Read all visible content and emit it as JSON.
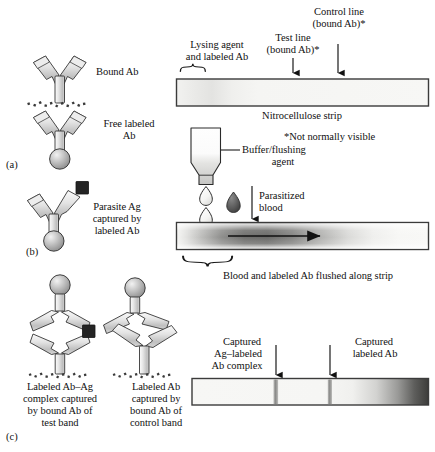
{
  "figure": {
    "panels": [
      "(a)",
      "(b)",
      "(c)"
    ]
  },
  "panel_labels": {
    "a": "(a)",
    "b": "(b)",
    "c": "(c)"
  },
  "left_column": {
    "bound_ab": "Bound Ab",
    "free_labeled_ab_line1": "Free labeled",
    "free_labeled_ab_line2": "Ab",
    "parasite_ag_line1": "Parasite Ag",
    "parasite_ag_line2": "captured by",
    "parasite_ag_line3": "labeled Ab",
    "test_complex_line1": "Labeled Ab–Ag",
    "test_complex_line2": "complex captured",
    "test_complex_line3": "by bound Ab of",
    "test_complex_line4": "test band",
    "control_complex_line1": "Labeled Ab",
    "control_complex_line2": "captured by",
    "control_complex_line3": "bound Ab of",
    "control_complex_line4": "control band"
  },
  "right_column": {
    "lysing_agent_line1": "Lysing agent",
    "lysing_agent_line2": "and labeled Ab",
    "test_line_line1": "Test line",
    "test_line_line2": "(bound Ab)*",
    "control_line_line1": "Control line",
    "control_line_line2": "(bound Ab)*",
    "nitrocellulose_strip": "Nitrocellulose strip",
    "footnote": "*Not normally visible",
    "buffer_line1": "Buffer/flushing",
    "buffer_line2": "agent",
    "parasitized_blood_line1": "Parasitized",
    "parasitized_blood_line2": "blood",
    "flushed_caption": "Blood and labeled Ab flushed along strip",
    "captured_complex_line1": "Captured",
    "captured_complex_line2": "Ag–labeled",
    "captured_complex_line3": "Ab complex",
    "captured_labeled_ab_line1": "Captured",
    "captured_labeled_ab_line2": "labeled Ab"
  },
  "colors": {
    "stroke": "#1a1a1a",
    "strip_fill": "#f4f4f2",
    "strip_border": "#4a4a4a",
    "sphere_light": "#e8e8e8",
    "sphere_mid": "#b9b9b9",
    "sphere_dark": "#8a8a8a",
    "arm_light": "#f0f0f0",
    "arm_mid": "#c9c9c9",
    "antigen_square": "#262626",
    "blood_drop": "#5e5e5e",
    "band_gray": "#8f8f8f",
    "text": "#111111"
  }
}
